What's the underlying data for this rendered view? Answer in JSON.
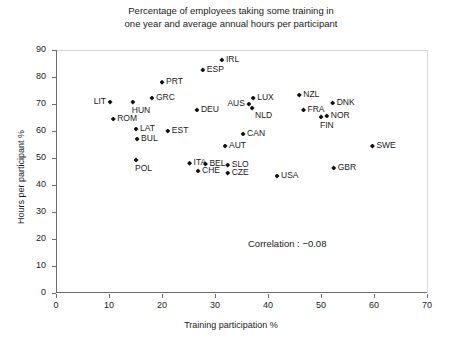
{
  "chart_data": {
    "type": "scatter",
    "title": "Percentage of employees taking some training in one year and average annual hours per participant",
    "title_line1": "Percentage of employees taking some training in",
    "title_line2": "one year and average annual hours per participant",
    "xlabel": "Training participation %",
    "ylabel": "Hours per participant %",
    "xlim": [
      0,
      70
    ],
    "ylim": [
      0,
      90
    ],
    "xticks": [
      0,
      10,
      20,
      30,
      40,
      50,
      60,
      70
    ],
    "yticks": [
      0,
      10,
      20,
      30,
      40,
      50,
      60,
      70,
      80,
      90
    ],
    "grid": false,
    "legend": "none",
    "annotation": "Correlation : −0.08",
    "points": [
      {
        "label": "IRL",
        "x": 31.3,
        "y": 86.3,
        "pos": "r"
      },
      {
        "label": "ESP",
        "x": 27.7,
        "y": 82.6,
        "pos": "r"
      },
      {
        "label": "PRT",
        "x": 20.0,
        "y": 78.1,
        "pos": "r"
      },
      {
        "label": "GRC",
        "x": 18.1,
        "y": 72.2,
        "pos": "r"
      },
      {
        "label": "LIT",
        "x": 10.2,
        "y": 70.7,
        "pos": "l"
      },
      {
        "label": "HUN",
        "x": 14.5,
        "y": 70.7,
        "pos": "b"
      },
      {
        "label": "LUX",
        "x": 37.2,
        "y": 72.2,
        "pos": "r"
      },
      {
        "label": "NLD",
        "x": 37.0,
        "y": 68.5,
        "pos": "br"
      },
      {
        "label": "AUS",
        "x": 36.4,
        "y": 70.0,
        "pos": "l"
      },
      {
        "label": "NZL",
        "x": 45.9,
        "y": 73.3,
        "pos": "r"
      },
      {
        "label": "DNK",
        "x": 52.2,
        "y": 70.4,
        "pos": "r"
      },
      {
        "label": "FRA",
        "x": 46.7,
        "y": 67.8,
        "pos": "r"
      },
      {
        "label": "NOR",
        "x": 51.1,
        "y": 65.6,
        "pos": "r"
      },
      {
        "label": "DEU",
        "x": 26.6,
        "y": 67.8,
        "pos": "r"
      },
      {
        "label": "ROM",
        "x": 10.8,
        "y": 64.4,
        "pos": "r"
      },
      {
        "label": "FIN",
        "x": 50.0,
        "y": 65.2,
        "pos": "b"
      },
      {
        "label": "LAT",
        "x": 15.1,
        "y": 60.7,
        "pos": "r"
      },
      {
        "label": "EST",
        "x": 21.1,
        "y": 60.0,
        "pos": "r"
      },
      {
        "label": "BUL",
        "x": 15.3,
        "y": 57.0,
        "pos": "r"
      },
      {
        "label": "CAN",
        "x": 35.3,
        "y": 58.9,
        "pos": "r"
      },
      {
        "label": "AUT",
        "x": 31.9,
        "y": 54.4,
        "pos": "r"
      },
      {
        "label": "SWE",
        "x": 59.7,
        "y": 54.4,
        "pos": "r"
      },
      {
        "label": "POL",
        "x": 15.1,
        "y": 49.3,
        "pos": "b"
      },
      {
        "label": "ITA",
        "x": 25.2,
        "y": 48.1,
        "pos": "r"
      },
      {
        "label": "BEL",
        "x": 28.2,
        "y": 47.8,
        "pos": "r"
      },
      {
        "label": "CHE",
        "x": 26.8,
        "y": 45.2,
        "pos": "r"
      },
      {
        "label": "SLO",
        "x": 32.4,
        "y": 47.4,
        "pos": "r"
      },
      {
        "label": "CZE",
        "x": 32.4,
        "y": 44.4,
        "pos": "r"
      },
      {
        "label": "GBR",
        "x": 52.4,
        "y": 46.3,
        "pos": "r"
      },
      {
        "label": "USA",
        "x": 41.7,
        "y": 43.3,
        "pos": "r"
      }
    ]
  }
}
